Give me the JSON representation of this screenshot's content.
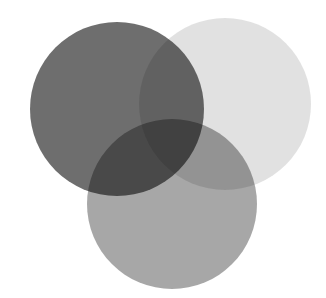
{
  "diagram": {
    "type": "venn",
    "background": "#ffffff",
    "circles": [
      {
        "name": "left",
        "cx": 117,
        "cy": 109,
        "r": 87,
        "color": "#555555",
        "opacity": 0.85
      },
      {
        "name": "right",
        "cx": 225,
        "cy": 104,
        "r": 86,
        "color": "#bdbdbd",
        "opacity": 0.45
      },
      {
        "name": "bottom",
        "cx": 172,
        "cy": 204,
        "r": 85,
        "color": "#8a8a8a",
        "opacity": 0.75
      }
    ]
  }
}
